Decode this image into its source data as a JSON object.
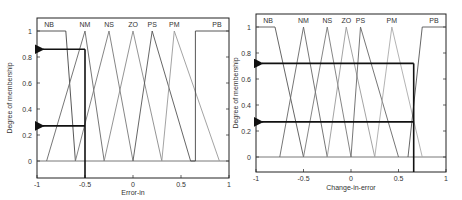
{
  "chart_data": [
    {
      "type": "line",
      "title": "",
      "xlabel": "Error-in",
      "ylabel": "Degree of membership",
      "xlim": [
        -1,
        1
      ],
      "ylim": [
        -0.1,
        1.1
      ],
      "xticks": [
        "-1",
        "-0.5",
        "0",
        "0.5",
        "1"
      ],
      "yticks": [
        "0",
        "0.2",
        "0.4",
        "0.6",
        "0.8",
        "1"
      ],
      "grid": false,
      "legend_position": "top (labels above peaks)",
      "series": [
        {
          "name": "NB",
          "x": [
            -1,
            -0.7,
            -0.6
          ],
          "values": [
            1,
            1,
            0
          ],
          "color": "#444444"
        },
        {
          "name": "NM",
          "x": [
            -0.9,
            -0.5,
            -0.3
          ],
          "values": [
            0,
            1,
            0
          ],
          "color": "#666666"
        },
        {
          "name": "NS",
          "x": [
            -0.6,
            -0.25,
            0
          ],
          "values": [
            0,
            1,
            0
          ],
          "color": "#777777"
        },
        {
          "name": "ZO",
          "x": [
            -0.3,
            0,
            0.3
          ],
          "values": [
            0,
            1,
            0
          ],
          "color": "#888888"
        },
        {
          "name": "PS",
          "x": [
            0,
            0.2,
            0.6
          ],
          "values": [
            0,
            1,
            0
          ],
          "color": "#555555"
        },
        {
          "name": "PM",
          "x": [
            0.3,
            0.43,
            0.9
          ],
          "values": [
            0,
            1,
            0
          ],
          "color": "#999999"
        },
        {
          "name": "PB",
          "x": [
            0.6,
            0.65,
            0.65,
            1
          ],
          "values": [
            0,
            0,
            1,
            1
          ],
          "color": "#444444"
        }
      ],
      "annotations": {
        "input_x": -0.5,
        "membership_arrows": [
          0.86,
          0.27
        ]
      }
    },
    {
      "type": "line",
      "title": "",
      "xlabel": "Change-in-error",
      "ylabel": "Degree of membership",
      "xlim": [
        -1,
        1
      ],
      "ylim": [
        -0.1,
        1.1
      ],
      "xticks": [
        "-1",
        "-0.5",
        "0",
        "0.5",
        "1"
      ],
      "yticks": [
        "0",
        "0.2",
        "0.4",
        "0.6",
        "0.8",
        "1"
      ],
      "grid": false,
      "legend_position": "top (labels above peaks)",
      "series": [
        {
          "name": "NB",
          "x": [
            -1,
            -0.8,
            -0.5
          ],
          "values": [
            1,
            1,
            0
          ],
          "color": "#555555"
        },
        {
          "name": "NM",
          "x": [
            -0.75,
            -0.5,
            -0.25
          ],
          "values": [
            0,
            1,
            0
          ],
          "color": "#666666"
        },
        {
          "name": "NS",
          "x": [
            -0.5,
            -0.25,
            0
          ],
          "values": [
            0,
            1,
            0
          ],
          "color": "#777777"
        },
        {
          "name": "ZO",
          "x": [
            -0.25,
            -0.05,
            0.25
          ],
          "values": [
            0,
            1,
            0
          ],
          "color": "#999999"
        },
        {
          "name": "PS",
          "x": [
            0,
            0.1,
            0.5
          ],
          "values": [
            0,
            1,
            0
          ],
          "color": "#666666"
        },
        {
          "name": "PM",
          "x": [
            0.25,
            0.43,
            0.75
          ],
          "values": [
            0,
            1,
            0
          ],
          "color": "#aaaaaa"
        },
        {
          "name": "PB",
          "x": [
            0.6,
            0.75,
            1
          ],
          "values": [
            0,
            1,
            1
          ],
          "color": "#555555"
        }
      ],
      "annotations": {
        "input_x": 0.66,
        "membership_arrows": [
          0.72,
          0.27
        ]
      }
    }
  ],
  "labels": {
    "left": {
      "xlabel": "Error-in",
      "ylabel": "Degree of membership"
    },
    "right": {
      "xlabel": "Change-in-error",
      "ylabel": "Degree of membership"
    }
  },
  "sets": [
    "NB",
    "NM",
    "NS",
    "ZO",
    "PS",
    "PM",
    "PB"
  ],
  "ticks": {
    "x": [
      "-1",
      "-0.5",
      "0",
      "0.5",
      "1"
    ],
    "y": [
      "0",
      "0.2",
      "0.4",
      "0.6",
      "0.8",
      "1"
    ]
  }
}
